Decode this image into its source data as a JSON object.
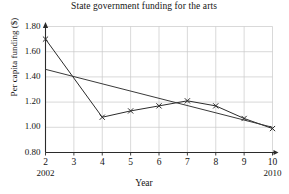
{
  "chart_data": {
    "type": "line",
    "title": "State government funding for the arts",
    "xlabel": "Year",
    "ylabel": "Per capita funding ($)",
    "x": [
      2,
      3,
      4,
      5,
      6,
      7,
      8,
      9,
      10
    ],
    "xtick_labels": [
      "2",
      "3",
      "4",
      "5",
      "6",
      "7",
      "8",
      "9",
      "10"
    ],
    "x_end_labels": {
      "start": "2002",
      "end": "2010"
    },
    "xlim": [
      2,
      10
    ],
    "ylim": [
      0.8,
      1.8
    ],
    "ytick_labels": [
      "0.80",
      "1.00",
      "1.20",
      "1.40",
      "1.60",
      "1.80"
    ],
    "ytick_values": [
      0.8,
      1.0,
      1.2,
      1.4,
      1.6,
      1.8
    ],
    "grid": true,
    "legend": "none",
    "series": [
      {
        "name": "Per capita funding",
        "marker": "x-cross",
        "color": "#2b2b2b",
        "x": [
          2,
          4,
          5,
          6,
          7,
          8,
          9,
          10
        ],
        "values": [
          1.7,
          1.08,
          1.13,
          1.17,
          1.21,
          1.17,
          1.07,
          0.99
        ]
      },
      {
        "name": "Trend line",
        "marker": "none",
        "color": "#3a3a3a",
        "x": [
          2,
          10
        ],
        "values": [
          1.46,
          1.0
        ]
      }
    ],
    "axis_arrows": {
      "x_right": true,
      "y_top": true
    }
  },
  "colors": {
    "grid": "#c9c9c9",
    "axis": "#2b2b2b",
    "text": "#141414",
    "background": "#ffffff"
  }
}
